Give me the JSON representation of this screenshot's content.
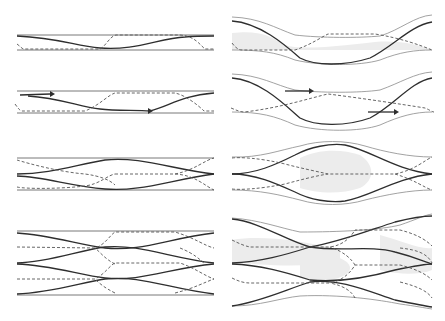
{
  "figure": {
    "caption_fragment": "",
    "layout": "2 columns x 4 rows of channel flow schematics",
    "legend": {
      "solid_line": "solid curve",
      "dashed_line": "dashed curve",
      "shaded_region": "grey shaded region"
    },
    "left_column": {
      "style": "straight parallel channel walls",
      "panels": [
        {
          "id": "L1",
          "crossings": 1,
          "channels": 1
        },
        {
          "id": "L2",
          "crossings": 2,
          "channels": 1,
          "arrows": 3
        },
        {
          "id": "L3",
          "crossings": 3,
          "channels": 2
        },
        {
          "id": "L4",
          "crossings": 5,
          "channels": 4
        }
      ]
    },
    "right_column": {
      "style": "deformed (wavy) channel walls with shaded regions",
      "panels": [
        {
          "id": "R1",
          "shape": "sagging trough"
        },
        {
          "id": "R2",
          "shape": "sagging trough with arrows"
        },
        {
          "id": "R3",
          "shape": "bulging lens"
        },
        {
          "id": "R4",
          "shape": "multi-channel braided"
        }
      ]
    },
    "colors": {
      "line": "#2e2e2e",
      "dashed": "#555555",
      "shade": "#ececec",
      "background": "#ffffff"
    }
  }
}
